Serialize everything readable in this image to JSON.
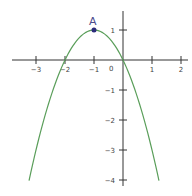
{
  "chart_data": {
    "type": "line",
    "title": "",
    "xlabel": "",
    "ylabel": "",
    "function": "y = -(x+1)^2 + 1",
    "xlim": [
      -3.6,
      2.2
    ],
    "ylim": [
      -4.2,
      1.6
    ],
    "grid": false,
    "x_ticks": [
      "-3",
      "-2",
      "-1",
      "1",
      "2"
    ],
    "y_ticks": [
      "1",
      "-1",
      "-2",
      "-3",
      "-4"
    ],
    "origin_label": "0",
    "series": [
      {
        "name": "parabola",
        "color": "#5a9e5a",
        "x": [
          -3.24,
          -3,
          -2.5,
          -2,
          -1.5,
          -1,
          -0.5,
          0,
          0.5,
          1,
          1.24
        ],
        "y": [
          -4.0,
          -3.0,
          -1.25,
          0,
          0.75,
          1,
          0.75,
          0,
          -1.25,
          -3.0,
          -4.0
        ]
      }
    ],
    "annotations": [
      {
        "label": "A",
        "x": -1,
        "y": 1,
        "color": "#2b2b7a"
      }
    ]
  }
}
